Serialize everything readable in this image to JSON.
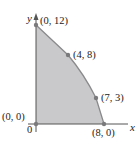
{
  "diagram": {
    "title": "",
    "type": "feasible-region",
    "colors": {
      "region_fill": "#c9c9cb",
      "boundary": "#8a8a8c",
      "axis": "#555555",
      "point": "#7a7a7c",
      "text": "#222222"
    },
    "axes": {
      "x_label": "x",
      "y_label": "y",
      "origin_label": "0"
    },
    "vertices": [
      {
        "label": "(0, 0)",
        "x": 0,
        "y": 0
      },
      {
        "label": "(0, 12)",
        "x": 0,
        "y": 12
      },
      {
        "label": "(4, 8)",
        "x": 4,
        "y": 8
      },
      {
        "label": "(7, 3)",
        "x": 7,
        "y": 3
      },
      {
        "label": "(8, 0)",
        "x": 8,
        "y": 0
      }
    ]
  }
}
